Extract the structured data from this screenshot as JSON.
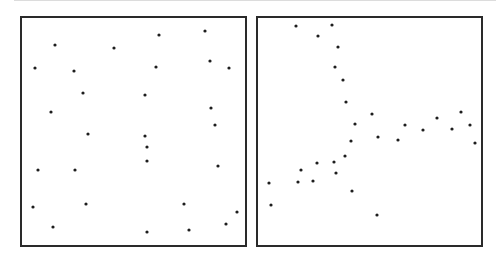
{
  "figure": {
    "dot_color": "#1e1e1e",
    "border_color": "#2a2a2a",
    "rule_color": "#dcdcdc"
  },
  "chart_data": [
    {
      "type": "scatter",
      "title": "",
      "panel": "left",
      "description": "random point pattern",
      "frame": {
        "x": 20,
        "y": 16,
        "width": 227,
        "height": 231
      },
      "points": [
        [
          53,
          43
        ],
        [
          112,
          46
        ],
        [
          33,
          66
        ],
        [
          72,
          69
        ],
        [
          81,
          91
        ],
        [
          49,
          110
        ],
        [
          157,
          33
        ],
        [
          203,
          29
        ],
        [
          208,
          59
        ],
        [
          154,
          65
        ],
        [
          227,
          66
        ],
        [
          143,
          93
        ],
        [
          209,
          106
        ],
        [
          213,
          123
        ],
        [
          86,
          132
        ],
        [
          145,
          145
        ],
        [
          36,
          168
        ],
        [
          73,
          168
        ],
        [
          31,
          205
        ],
        [
          84,
          202
        ],
        [
          51,
          225
        ],
        [
          143,
          134
        ],
        [
          145,
          159
        ],
        [
          216,
          164
        ],
        [
          182,
          202
        ],
        [
          235,
          210
        ],
        [
          224,
          222
        ],
        [
          145,
          230
        ],
        [
          187,
          228
        ]
      ]
    },
    {
      "type": "scatter",
      "title": "",
      "panel": "right",
      "description": "structured point pattern forming branching curves",
      "frame": {
        "x": 256,
        "y": 16,
        "width": 227,
        "height": 231
      },
      "points": [
        [
          294,
          24
        ],
        [
          330,
          23
        ],
        [
          316,
          34
        ],
        [
          336,
          45
        ],
        [
          333,
          65
        ],
        [
          341,
          78
        ],
        [
          344,
          100
        ],
        [
          353,
          122
        ],
        [
          370,
          112
        ],
        [
          376,
          135
        ],
        [
          396,
          138
        ],
        [
          403,
          123
        ],
        [
          421,
          128
        ],
        [
          435,
          116
        ],
        [
          450,
          127
        ],
        [
          459,
          110
        ],
        [
          468,
          123
        ],
        [
          473,
          141
        ],
        [
          349,
          139
        ],
        [
          343,
          154
        ],
        [
          332,
          160
        ],
        [
          334,
          171
        ],
        [
          315,
          161
        ],
        [
          311,
          179
        ],
        [
          299,
          168
        ],
        [
          296,
          180
        ],
        [
          267,
          181
        ],
        [
          269,
          203
        ],
        [
          350,
          189
        ],
        [
          375,
          213
        ]
      ]
    }
  ]
}
